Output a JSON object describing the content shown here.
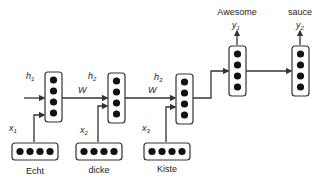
{
  "diagram": {
    "type": "encoder-decoder RNN",
    "hidden_labels": [
      "h1",
      "h2",
      "h3"
    ],
    "hidden_label_parts": [
      {
        "base": "h",
        "sub": "1"
      },
      {
        "base": "h",
        "sub": "2"
      },
      {
        "base": "h",
        "sub": "3"
      }
    ],
    "weight_label": "W",
    "input_labels": [
      {
        "base": "x",
        "sub": "1"
      },
      {
        "base": "x",
        "sub": "2"
      },
      {
        "base": "x",
        "sub": "3"
      }
    ],
    "input_words": [
      "Echt",
      "dicke",
      "Kiste"
    ],
    "output_labels": [
      {
        "base": "y",
        "sub": "1"
      },
      {
        "base": "y",
        "sub": "2"
      }
    ],
    "output_words": [
      "Awesome",
      "sauce"
    ],
    "colors": {
      "stroke": "#333333",
      "node": "#111111",
      "background": "#ffffff"
    }
  }
}
